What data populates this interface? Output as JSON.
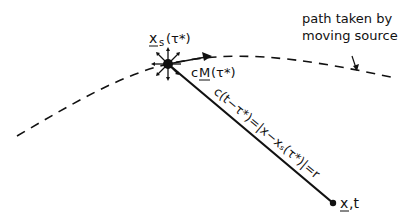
{
  "figure": {
    "annotation": {
      "line1": "path taken by",
      "line2": "moving source"
    },
    "source_label": {
      "x": "x",
      "sub": "s",
      "arg": "(τ*)"
    },
    "velocity_label": {
      "c": "c",
      "M": "M",
      "arg": "(τ*)"
    },
    "distance_equation": "c(t−τ*)=|x−xₛ(τ*)|=r",
    "observer_label": {
      "x": "x",
      "rest": ",t"
    },
    "colors": {
      "ink": "#111111",
      "background": "#ffffff"
    }
  }
}
